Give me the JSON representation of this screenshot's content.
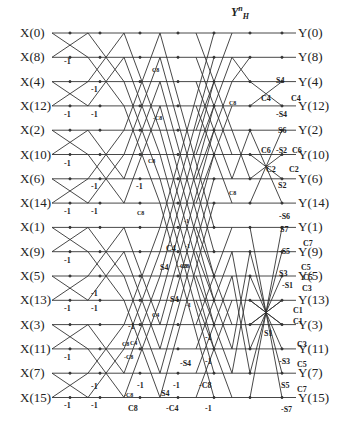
{
  "title": {
    "base": "Y",
    "sup": "n",
    "sub": "H"
  },
  "inputs": [
    "X(0)",
    "X(8)",
    "X(4)",
    "X(12)",
    "X(2)",
    "X(10)",
    "X(6)",
    "X(14)",
    "X(1)",
    "X(9)",
    "X(5)",
    "X(13)",
    "X(3)",
    "X(11)",
    "X(7)",
    "X(15)"
  ],
  "outputs": [
    "Y(0)",
    "Y(8)",
    "Y(4)",
    "Y(12)",
    "Y(2)",
    "Y(10)",
    "Y(6)",
    "Y(14)",
    "Y(1)",
    "Y(9)",
    "Y(5)",
    "Y(13)",
    "Y(3)",
    "Y(11)",
    "Y(7)",
    "Y(15)"
  ],
  "row_y_start": 33,
  "row_spacing": 24.3,
  "coefficients": [
    {
      "t": "-1",
      "x": 64,
      "y": 58
    },
    {
      "t": "-1",
      "x": 64,
      "y": 111
    },
    {
      "t": "-1",
      "x": 91,
      "y": 111
    },
    {
      "t": "-1",
      "x": 91,
      "y": 86
    },
    {
      "t": "-1",
      "x": 64,
      "y": 160
    },
    {
      "t": "-1",
      "x": 91,
      "y": 183
    },
    {
      "t": "-1",
      "x": 64,
      "y": 208
    },
    {
      "t": "-1",
      "x": 91,
      "y": 208
    },
    {
      "t": "-1",
      "x": 136,
      "y": 183
    },
    {
      "t": "C8",
      "x": 137,
      "y": 210,
      "s": 1
    },
    {
      "t": "C8",
      "x": 152,
      "y": 67,
      "s": 1
    },
    {
      "t": "-C8",
      "x": 153,
      "y": 115,
      "s": 1
    },
    {
      "t": "C8",
      "x": 148,
      "y": 158,
      "s": 1
    },
    {
      "t": "-1",
      "x": 64,
      "y": 257
    },
    {
      "t": "-1",
      "x": 64,
      "y": 305
    },
    {
      "t": "-1",
      "x": 91,
      "y": 305
    },
    {
      "t": "-1",
      "x": 91,
      "y": 290
    },
    {
      "t": "-1",
      "x": 64,
      "y": 354
    },
    {
      "t": "-1",
      "x": 64,
      "y": 402
    },
    {
      "t": "-1",
      "x": 91,
      "y": 383
    },
    {
      "t": "-1",
      "x": 91,
      "y": 402
    },
    {
      "t": "C4",
      "x": 166,
      "y": 245
    },
    {
      "t": "S4",
      "x": 160,
      "y": 264
    },
    {
      "t": "S4",
      "x": 170,
      "y": 296
    },
    {
      "t": "-C8",
      "x": 178,
      "y": 263,
      "s": 1
    },
    {
      "t": "C4",
      "x": 152,
      "y": 312,
      "s": 1
    },
    {
      "t": "C8",
      "x": 122,
      "y": 341,
      "s": 1
    },
    {
      "t": "-C8",
      "x": 124,
      "y": 354,
      "s": 1
    },
    {
      "t": "C4",
      "x": 130,
      "y": 340,
      "s": 1
    },
    {
      "t": "-1",
      "x": 128,
      "y": 323
    },
    {
      "t": "-S4",
      "x": 180,
      "y": 360
    },
    {
      "t": "-1",
      "x": 137,
      "y": 382
    },
    {
      "t": "-1",
      "x": 173,
      "y": 382
    },
    {
      "t": "S4",
      "x": 161,
      "y": 390
    },
    {
      "t": "-C8",
      "x": 124,
      "y": 392,
      "s": 1
    },
    {
      "t": "C8",
      "x": 128,
      "y": 405
    },
    {
      "t": "-C4",
      "x": 166,
      "y": 405
    },
    {
      "t": "-1",
      "x": 205,
      "y": 334
    },
    {
      "t": "-1",
      "x": 205,
      "y": 358
    },
    {
      "t": "-C8",
      "x": 199,
      "y": 382
    },
    {
      "t": "-1",
      "x": 205,
      "y": 405
    },
    {
      "t": "C8",
      "x": 229,
      "y": 100,
      "s": 1
    },
    {
      "t": "C8",
      "x": 229,
      "y": 190,
      "s": 1
    },
    {
      "t": "-1",
      "x": 184,
      "y": 218,
      "s": 1
    },
    {
      "t": "-1",
      "x": 185,
      "y": 243,
      "s": 1
    },
    {
      "t": "-C8",
      "x": 180,
      "y": 263,
      "s": 1
    },
    {
      "t": "-1",
      "x": 186,
      "y": 302,
      "s": 1
    },
    {
      "t": "S4",
      "x": 276,
      "y": 77
    },
    {
      "t": "C4",
      "x": 261,
      "y": 95
    },
    {
      "t": "C4",
      "x": 291,
      "y": 95
    },
    {
      "t": "-S4",
      "x": 276,
      "y": 111
    },
    {
      "t": "S6",
      "x": 278,
      "y": 127
    },
    {
      "t": "C6",
      "x": 261,
      "y": 147
    },
    {
      "t": "-S2",
      "x": 276,
      "y": 147
    },
    {
      "t": "C6",
      "x": 292,
      "y": 147
    },
    {
      "t": "C2",
      "x": 266,
      "y": 166
    },
    {
      "t": "C2",
      "x": 289,
      "y": 166
    },
    {
      "t": "S2",
      "x": 278,
      "y": 182
    },
    {
      "t": "-S6",
      "x": 279,
      "y": 213
    },
    {
      "t": "S7",
      "x": 280,
      "y": 226
    },
    {
      "t": "C7",
      "x": 303,
      "y": 240
    },
    {
      "t": "-S5",
      "x": 279,
      "y": 248
    },
    {
      "t": "C5",
      "x": 301,
      "y": 264
    },
    {
      "t": "S3",
      "x": 279,
      "y": 270
    },
    {
      "t": "C5",
      "x": 303,
      "y": 274
    },
    {
      "t": "-S1",
      "x": 282,
      "y": 282
    },
    {
      "t": "C3",
      "x": 302,
      "y": 285
    },
    {
      "t": "C1",
      "x": 293,
      "y": 307
    },
    {
      "t": "C1",
      "x": 293,
      "y": 318
    },
    {
      "t": "S1",
      "x": 264,
      "y": 330
    },
    {
      "t": "C3",
      "x": 297,
      "y": 341
    },
    {
      "t": "-S3",
      "x": 279,
      "y": 358
    },
    {
      "t": "C5",
      "x": 297,
      "y": 361
    },
    {
      "t": "S5",
      "x": 281,
      "y": 382
    },
    {
      "t": "C7",
      "x": 297,
      "y": 386
    },
    {
      "t": "-S7",
      "x": 281,
      "y": 406
    }
  ],
  "styles": {
    "line_color": "#333333",
    "text_color": "#222222"
  }
}
